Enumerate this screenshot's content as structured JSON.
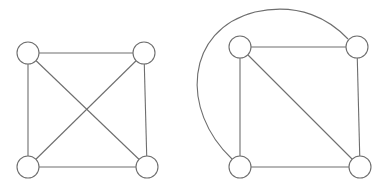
{
  "diagram": {
    "title": "",
    "stroke_color": "#6e6e6e",
    "background": "#ffffff",
    "node_radius": 11,
    "graphs": [
      {
        "name": "K4 drawing with crossing",
        "nodes": [
          {
            "id": "a",
            "x": 28,
            "y": 53
          },
          {
            "id": "b",
            "x": 144,
            "y": 53
          },
          {
            "id": "c",
            "x": 28,
            "y": 167
          },
          {
            "id": "d",
            "x": 147,
            "y": 167
          }
        ],
        "edges": [
          [
            "a",
            "b"
          ],
          [
            "a",
            "c"
          ],
          [
            "b",
            "d"
          ],
          [
            "c",
            "d"
          ],
          [
            "a",
            "d"
          ],
          [
            "b",
            "c"
          ]
        ]
      },
      {
        "name": "K4 planar drawing",
        "nodes": [
          {
            "id": "a",
            "x": 240,
            "y": 47
          },
          {
            "id": "b",
            "x": 357,
            "y": 47
          },
          {
            "id": "c",
            "x": 240,
            "y": 167
          },
          {
            "id": "d",
            "x": 360,
            "y": 167
          }
        ],
        "edges": [
          [
            "a",
            "b"
          ],
          [
            "a",
            "c"
          ],
          [
            "b",
            "d"
          ],
          [
            "c",
            "d"
          ],
          [
            "a",
            "d"
          ]
        ],
        "curved_edges": [
          {
            "from": "c",
            "to": "b",
            "path": "M 232 159 C 180 110, 185 30, 255 12 C 300 2, 330 20, 348 39"
          }
        ]
      }
    ]
  }
}
